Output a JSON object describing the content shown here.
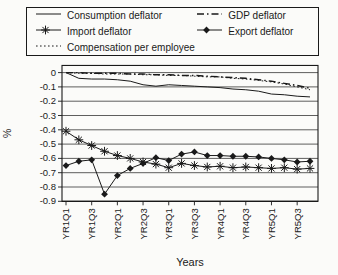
{
  "chart_data": {
    "type": "line",
    "title": "",
    "xlabel": "Years",
    "ylabel": "%",
    "ylim": [
      -0.9,
      0.05
    ],
    "grid": "horizontal",
    "legend_position": "top",
    "line_color": "#1a1a1a",
    "categories": [
      "YR1Q1",
      "YR1Q2",
      "YR1Q3",
      "YR1Q4",
      "YR2Q1",
      "YR2Q2",
      "YR2Q3",
      "YR2Q4",
      "YR3Q1",
      "YR3Q2",
      "YR3Q3",
      "YR3Q4",
      "YR4Q1",
      "YR4Q2",
      "YR4Q3",
      "YR4Q4",
      "YR5Q1",
      "YR5Q2",
      "YR5Q3",
      "YR5Q4"
    ],
    "x_tick_labels": [
      "YR1Q1",
      "YR1Q3",
      "YR2Q1",
      "YR2Q3",
      "YR3Q1",
      "YR3Q3",
      "YR4Q1",
      "YR4Q3",
      "YR5Q1",
      "YR5Q3"
    ],
    "y_tick_labels": [
      "0",
      "-0.1",
      "-0.2",
      "-0.3",
      "-0.4",
      "-0.5",
      "-0.6",
      "-0.7",
      "-0.8",
      "-0.9"
    ],
    "series": [
      {
        "name": "Consumption deflator",
        "line_style": "solid",
        "marker": "none",
        "values": [
          0,
          -0.04,
          -0.045,
          -0.045,
          -0.05,
          -0.06,
          -0.085,
          -0.095,
          -0.085,
          -0.09,
          -0.095,
          -0.1,
          -0.105,
          -0.115,
          -0.12,
          -0.13,
          -0.15,
          -0.155,
          -0.165,
          -0.17
        ]
      },
      {
        "name": "GDP deflator",
        "line_style": "dash-dot",
        "marker": "none",
        "values": [
          0,
          0,
          -0.005,
          -0.005,
          -0.005,
          -0.01,
          -0.01,
          -0.015,
          -0.015,
          -0.02,
          -0.02,
          -0.025,
          -0.03,
          -0.035,
          -0.04,
          -0.05,
          -0.06,
          -0.075,
          -0.09,
          -0.11
        ]
      },
      {
        "name": "Import deflator",
        "line_style": "solid",
        "marker": "asterisk",
        "values": [
          -0.41,
          -0.47,
          -0.51,
          -0.55,
          -0.58,
          -0.6,
          -0.625,
          -0.64,
          -0.665,
          -0.635,
          -0.65,
          -0.66,
          -0.655,
          -0.665,
          -0.66,
          -0.665,
          -0.67,
          -0.665,
          -0.675,
          -0.67
        ]
      },
      {
        "name": "Export deflator",
        "line_style": "solid",
        "marker": "diamond",
        "values": [
          -0.65,
          -0.62,
          -0.61,
          -0.85,
          -0.72,
          -0.67,
          -0.635,
          -0.595,
          -0.615,
          -0.57,
          -0.555,
          -0.58,
          -0.58,
          -0.585,
          -0.585,
          -0.59,
          -0.6,
          -0.61,
          -0.625,
          -0.62
        ]
      },
      {
        "name": "Compensation per employee",
        "line_style": "dotted",
        "marker": "none",
        "values": [
          0,
          -0.005,
          -0.005,
          -0.01,
          -0.01,
          -0.01,
          -0.015,
          -0.015,
          -0.02,
          -0.02,
          -0.025,
          -0.03,
          -0.03,
          -0.04,
          -0.045,
          -0.055,
          -0.065,
          -0.08,
          -0.1,
          -0.12
        ]
      }
    ]
  },
  "legend": {
    "items": [
      {
        "label": "Consumption deflator",
        "series_index": 0
      },
      {
        "label": "GDP deflator",
        "series_index": 1
      },
      {
        "label": "Import deflator",
        "series_index": 2
      },
      {
        "label": "Export deflator",
        "series_index": 3
      },
      {
        "label": "Compensation per employee",
        "series_index": 4
      }
    ]
  },
  "axes": {
    "x_title": "Years",
    "y_title": "%"
  }
}
